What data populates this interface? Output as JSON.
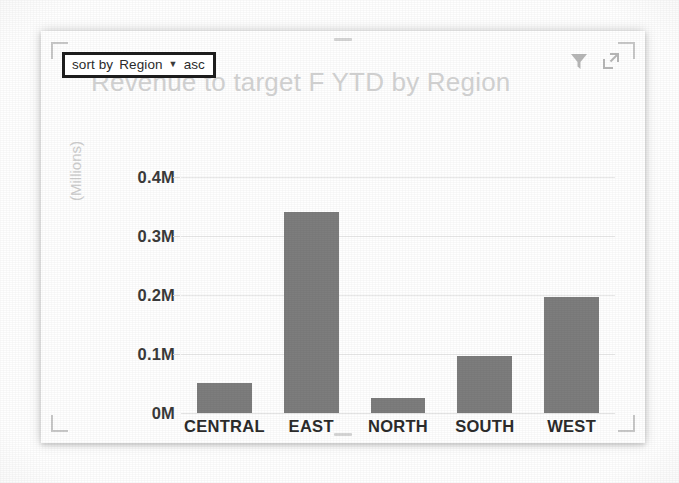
{
  "visual": {
    "title": "Revenue to target F YTD by Region",
    "sort_tooltip": {
      "prefix": "sort by",
      "field": "Region",
      "caret": "▼",
      "direction": "asc",
      "full_text": "sort by Region ▼ asc"
    },
    "header_icons": [
      {
        "name": "filter-icon",
        "label": "Filters"
      },
      {
        "name": "focus-mode-icon",
        "label": "Focus mode"
      }
    ],
    "bar_color": "#7d7d7d",
    "title_color": "#cfcfcf",
    "gridline_color": "#e9e9e9"
  },
  "chart_data": {
    "type": "bar",
    "title": "Revenue to target F YTD by Region",
    "categories": [
      "CENTRAL",
      "EAST",
      "NORTH",
      "SOUTH",
      "WEST"
    ],
    "values": [
      0.05,
      0.34,
      0.025,
      0.097,
      0.197
    ],
    "value_unit": "Millions",
    "xlabel": "",
    "ylabel": "(Millions)",
    "ylim": [
      0,
      0.45
    ],
    "ytick_values": [
      0,
      0.1,
      0.2,
      0.3,
      0.4
    ],
    "ytick_labels": [
      "0M",
      "0.1M",
      "0.2M",
      "0.3M",
      "0.4M"
    ],
    "grid": true,
    "legend": false,
    "orientation": "vertical"
  }
}
